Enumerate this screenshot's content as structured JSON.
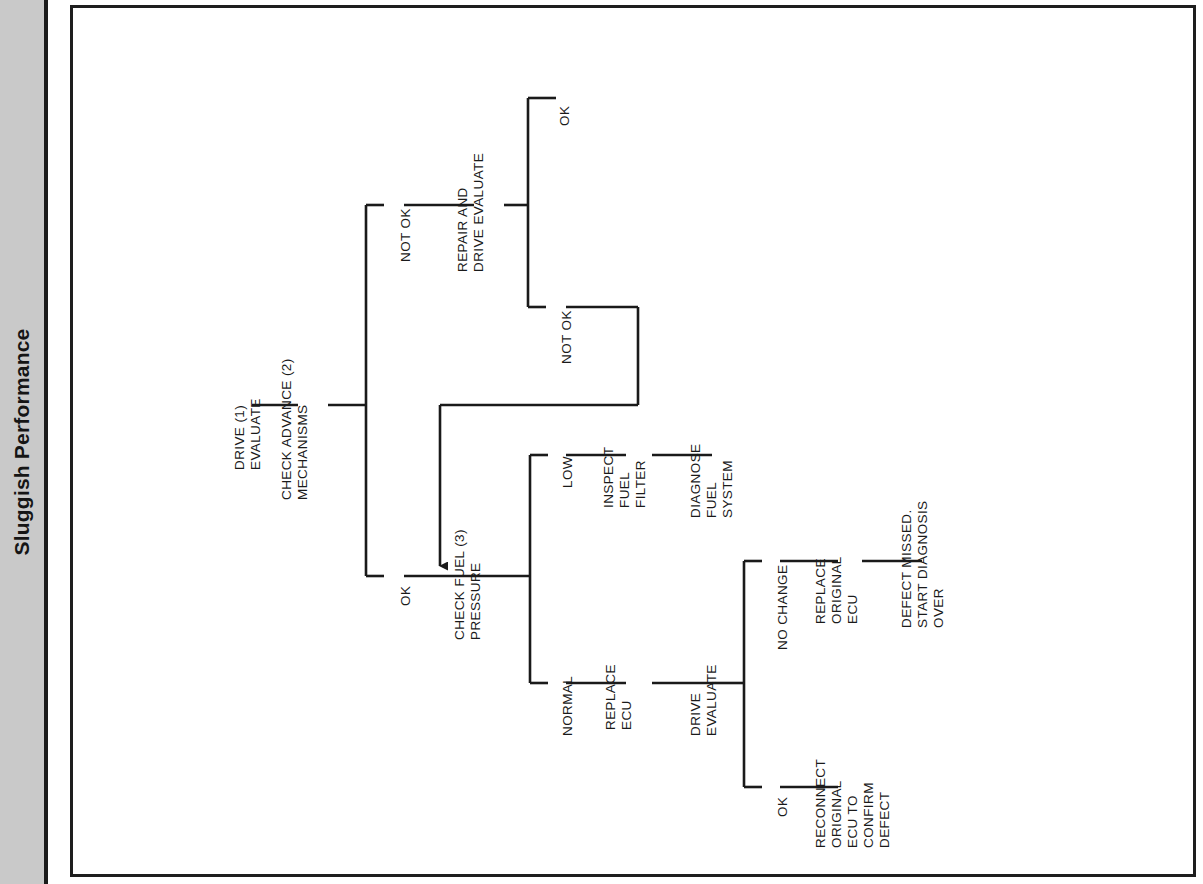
{
  "page": {
    "chapter_title": "Sluggish Performance",
    "title_orientation": "vertical-rotated-90ccw"
  },
  "diagram": {
    "type": "flowchart",
    "orientation": "rotated-90-counterclockwise",
    "nodes": {
      "drive_evaluate_1": [
        "DRIVE (1)",
        "EVALUATE"
      ],
      "check_advance_2": [
        "CHECK ADVANCE (2)",
        "MECHANISMS"
      ],
      "repair_and_drive_evaluate": [
        "REPAIR AND",
        "DRIVE EVALUATE"
      ],
      "check_fuel_pressure_3": [
        "CHECK FUEL (3)",
        "PRESSURE"
      ],
      "inspect_fuel_filter": [
        "INSPECT",
        "FUEL",
        "FILTER"
      ],
      "diagnose_fuel_system": [
        "DIAGNOSE",
        "FUEL",
        "SYSTEM"
      ],
      "replace_ecu": [
        "REPLACE",
        "ECU"
      ],
      "drive_evaluate_2": [
        "DRIVE",
        "EVALUATE"
      ],
      "replace_original_ecu": [
        "REPLACE",
        "ORIGINAL",
        "ECU"
      ],
      "defect_missed": [
        "DEFECT MISSED.",
        "START DIAGNOSIS",
        "OVER"
      ],
      "reconnect_original_ecu": [
        "RECONNECT",
        "ORIGINAL",
        "ECU TO",
        "CONFIRM",
        "DEFECT"
      ]
    },
    "branch_labels": {
      "advance_not_ok": "NOT OK",
      "advance_ok": "OK",
      "repair_ok": "OK",
      "repair_not_ok": "NOT OK",
      "fuel_low": "LOW",
      "fuel_normal": "NORMAL",
      "drive_no_change": "NO CHANGE",
      "drive_ok": "OK"
    },
    "edges": [
      {
        "from": "drive_evaluate_1",
        "to": "check_advance_2",
        "label": ""
      },
      {
        "from": "check_advance_2",
        "to": "repair_and_drive_evaluate",
        "label": "NOT OK"
      },
      {
        "from": "check_advance_2",
        "to": "check_fuel_pressure_3",
        "label": "OK"
      },
      {
        "from": "repair_and_drive_evaluate",
        "to": "end",
        "label": "OK"
      },
      {
        "from": "repair_and_drive_evaluate",
        "to": "check_fuel_pressure_3",
        "label": "NOT OK",
        "style": "feedback-arrow"
      },
      {
        "from": "check_fuel_pressure_3",
        "to": "inspect_fuel_filter",
        "label": "LOW"
      },
      {
        "from": "inspect_fuel_filter",
        "to": "diagnose_fuel_system",
        "label": ""
      },
      {
        "from": "check_fuel_pressure_3",
        "to": "replace_ecu",
        "label": "NORMAL"
      },
      {
        "from": "replace_ecu",
        "to": "drive_evaluate_2",
        "label": ""
      },
      {
        "from": "drive_evaluate_2",
        "to": "replace_original_ecu",
        "label": "NO CHANGE"
      },
      {
        "from": "replace_original_ecu",
        "to": "defect_missed",
        "label": ""
      },
      {
        "from": "drive_evaluate_2",
        "to": "reconnect_original_ecu",
        "label": "OK"
      }
    ],
    "colors": {
      "line": "#1a1a1a",
      "text": "#1a1a1a",
      "sidebar": "#c9c9c9",
      "frame": "#1e1e1e",
      "background": "#ffffff"
    }
  }
}
